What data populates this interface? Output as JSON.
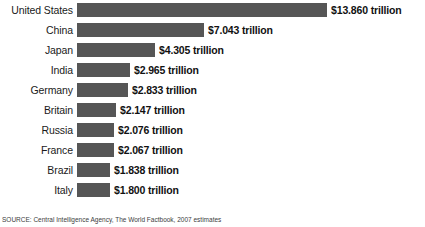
{
  "chart_data": {
    "type": "bar",
    "orientation": "horizontal",
    "title": "",
    "xlabel": "",
    "ylabel": "",
    "unit": "trillion USD",
    "grid": false,
    "legend": false,
    "xlim": [
      0,
      13.86
    ],
    "categories": [
      "United States",
      "China",
      "Japan",
      "India",
      "Germany",
      "Britain",
      "Russia",
      "France",
      "Brazil",
      "Italy"
    ],
    "values": [
      13.86,
      7.043,
      4.305,
      2.965,
      2.833,
      2.147,
      2.076,
      2.067,
      1.838,
      1.8
    ],
    "value_labels": [
      "$13.860 trillion",
      "$7.043 trillion",
      "$4.305 trillion",
      "$2.965 trillion",
      "$2.833 trillion",
      "$2.147 trillion",
      "$2.076 trillion",
      "$2.067 trillion",
      "$1.838 trillion",
      "$1.800 trillion"
    ],
    "bar_color": "#565656",
    "background_color": "#ffffff",
    "px_per_unit": 18.04
  },
  "rows": [
    {
      "label": "United States",
      "value": 13.86,
      "value_label": "$13.860 trillion",
      "bar_width": "250px"
    },
    {
      "label": "China",
      "value": 7.043,
      "value_label": "$7.043 trillion",
      "bar_width": "127px"
    },
    {
      "label": "Japan",
      "value": 4.305,
      "value_label": "$4.305 trillion",
      "bar_width": "78px"
    },
    {
      "label": "India",
      "value": 2.965,
      "value_label": "$2.965 trillion",
      "bar_width": "53px"
    },
    {
      "label": "Germany",
      "value": 2.833,
      "value_label": "$2.833 trillion",
      "bar_width": "51px"
    },
    {
      "label": "Britain",
      "value": 2.147,
      "value_label": "$2.147 trillion",
      "bar_width": "39px"
    },
    {
      "label": "Russia",
      "value": 2.076,
      "value_label": "$2.076 trillion",
      "bar_width": "37px"
    },
    {
      "label": "France",
      "value": 2.067,
      "value_label": "$2.067 trillion",
      "bar_width": "37px"
    },
    {
      "label": "Brazil",
      "value": 1.838,
      "value_label": "$1.838 trillion",
      "bar_width": "33px"
    },
    {
      "label": "Italy",
      "value": 1.8,
      "value_label": "$1.800 trillion",
      "bar_width": "33px"
    }
  ],
  "footer": {
    "source": "SOURCE: Central Intelligence Agency, The World Factbook, 2007 estimates"
  }
}
